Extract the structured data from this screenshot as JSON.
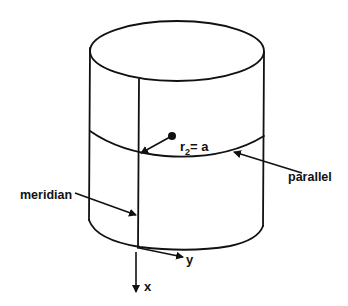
{
  "diagram": {
    "labels": {
      "radius_r": "r",
      "radius_sub": "2",
      "radius_rest": "= a",
      "parallel": "parallel",
      "meridian": "meridian",
      "axis_x": "x",
      "axis_y": "y"
    },
    "colors": {
      "stroke": "#111111",
      "background": "#ffffff"
    }
  }
}
